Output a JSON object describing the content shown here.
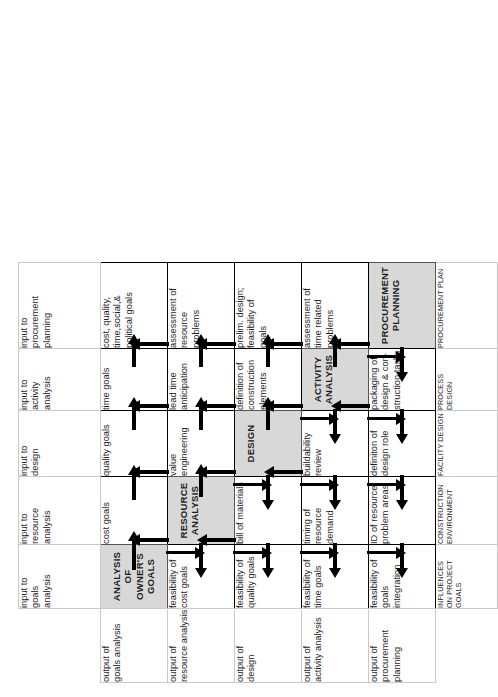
{
  "diagram": {
    "orientation": "rotated-90-ccw",
    "diagonal_fill": "#d8d8d8",
    "column_headers": [
      "input to\ngoals\nanalysis",
      "input to\nresource\nanalysis",
      "input to\ndesign",
      "input to\nactivity\nanalysis",
      "input to\nprocurement\nplanning"
    ],
    "row_headers": [
      "output of\ngoals analysis",
      "output of\nresource analysis",
      "output of\ndesign",
      "output of\nactivity analysis",
      "output of\nprocurement\nplanning"
    ],
    "footer_labels": [
      "INFLUENCES\nON PROJECT\nGOALS",
      "CONSTRUCTION\nENVIRONMENT",
      "FACILITY DESIGN",
      "PROCESS DESIGN",
      "PROCUREMENT PLAN"
    ],
    "cells": [
      [
        {
          "text": "ANALYSIS OF\nOWNER'S\nGOALS",
          "diagonal": true
        },
        {
          "text": "cost goals",
          "diagonal": false
        },
        {
          "text": "quality goals",
          "diagonal": false
        },
        {
          "text": "time goals",
          "diagonal": false
        },
        {
          "text": "cost, quality,\ntime,social,&\npolitical goals",
          "diagonal": false
        }
      ],
      [
        {
          "text": "feasibility of\ncost goals",
          "diagonal": false
        },
        {
          "text": "RESOURCE\nANALYSIS",
          "diagonal": true
        },
        {
          "text": "value\nengineering",
          "diagonal": false
        },
        {
          "text": "lead time\nanticipation",
          "diagonal": false
        },
        {
          "text": "assessment of\nresource\nproblems",
          "diagonal": false
        }
      ],
      [
        {
          "text": "feasibility of\nquality goals",
          "diagonal": false
        },
        {
          "text": "bill of materials",
          "diagonal": false
        },
        {
          "text": "DESIGN",
          "diagonal": true
        },
        {
          "text": "definition of\nconstruction\nelements",
          "diagonal": false
        },
        {
          "text": "prelim. design;\nfeasibility of\ngoals",
          "diagonal": false
        }
      ],
      [
        {
          "text": "feasibility of\ntime goals",
          "diagonal": false
        },
        {
          "text": "timing of\nresource\ndemand",
          "diagonal": false
        },
        {
          "text": "buildability\nreview",
          "diagonal": false
        },
        {
          "text": "ACTIVITY\nANALYSIS",
          "diagonal": true
        },
        {
          "text": "assessment of\ntime related\nproblems",
          "diagonal": false
        }
      ],
      [
        {
          "text": "feasibility of\ngoals integration",
          "diagonal": false
        },
        {
          "text": "ID of resource\nproblem areas",
          "diagonal": false
        },
        {
          "text": "definiton of\ndesign role",
          "diagonal": false
        },
        {
          "text": "packaging of\ndesign & con-\nstruction tasks",
          "diagonal": false
        },
        {
          "text": "PROCUREMENT\nPLANNING",
          "diagonal": true
        }
      ]
    ],
    "arrows": {
      "description": "Below-diagonal cells feed rightward; above-diagonal cells feed leftward; vertical arrows run down the upper triangle and up the lower triangle.",
      "right_rows": [
        1,
        2,
        3,
        4,
        5
      ],
      "left_rows": [
        1,
        2,
        3,
        4,
        5
      ]
    }
  }
}
